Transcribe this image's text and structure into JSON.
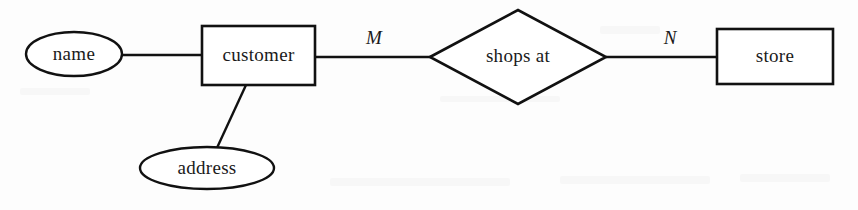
{
  "diagram": {
    "type": "entity-relationship-diagram",
    "title": "",
    "background_color": "#fdfdfd",
    "line_color": "#111111",
    "entities": [
      {
        "id": "customer",
        "label": "customer",
        "shape": "rectangle",
        "x": 202,
        "y": 26,
        "width": 113,
        "height": 59
      },
      {
        "id": "store",
        "label": "store",
        "shape": "rectangle",
        "x": 717,
        "y": 29,
        "width": 116,
        "height": 55
      }
    ],
    "attributes": [
      {
        "id": "name",
        "label": "name",
        "shape": "ellipse",
        "cx": 74,
        "cy": 54,
        "rx": 48,
        "ry": 22,
        "attached_to": "customer"
      },
      {
        "id": "address",
        "label": "address",
        "shape": "ellipse",
        "cx": 207,
        "cy": 168,
        "rx": 67,
        "ry": 21,
        "attached_to": "customer"
      }
    ],
    "relationships": [
      {
        "id": "shops-at",
        "label": "shops at",
        "shape": "diamond",
        "cx": 518,
        "cy": 57,
        "half_width": 88,
        "half_height": 47,
        "connects": [
          "customer",
          "store"
        ]
      }
    ],
    "cardinality_labels": [
      {
        "id": "cardinality-m",
        "label": "M",
        "x": 374,
        "y": 40,
        "edge": "customer-to-shops-at"
      },
      {
        "id": "cardinality-n",
        "label": "N",
        "x": 670,
        "y": 40,
        "edge": "shops-at-to-store"
      }
    ],
    "connectors": [
      {
        "id": "name-to-customer",
        "x1": 122,
        "y1": 55,
        "x2": 203,
        "y2": 55
      },
      {
        "id": "customer-to-shops-at",
        "x1": 314,
        "y1": 57,
        "x2": 431,
        "y2": 57
      },
      {
        "id": "shops-at-to-store",
        "x1": 606,
        "y1": 57,
        "x2": 718,
        "y2": 57
      },
      {
        "id": "customer-to-address",
        "x1": 246,
        "y1": 85,
        "x2": 216,
        "y2": 150
      }
    ]
  }
}
